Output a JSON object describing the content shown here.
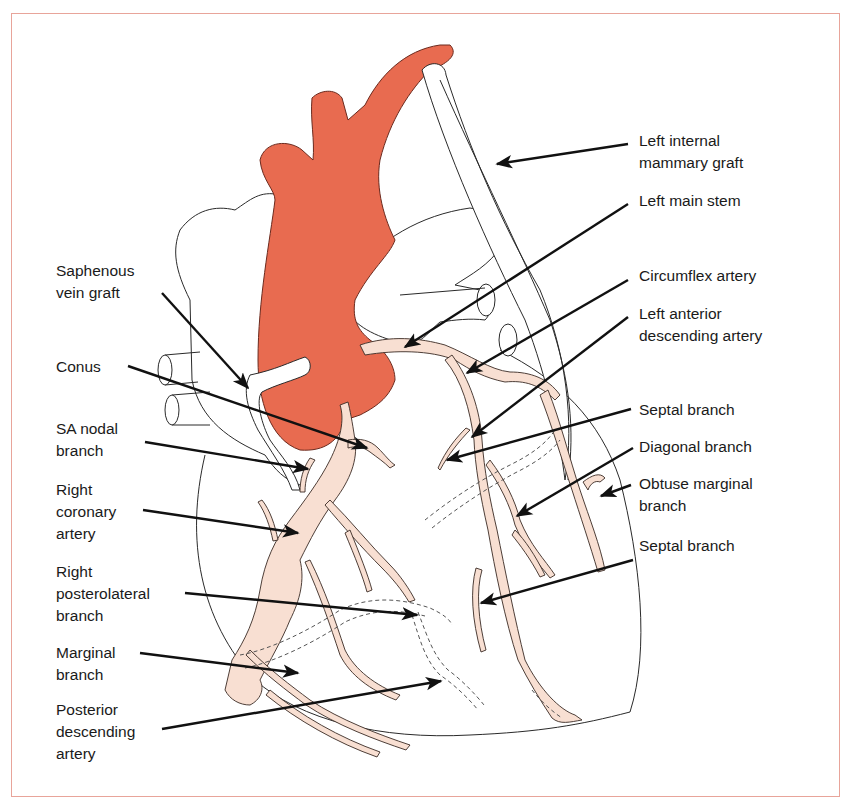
{
  "figure": {
    "colors": {
      "aorta": "#E86B50",
      "coronary": "#F8DFD2",
      "outline": "#2a2a2a",
      "frame": "#E8A49A",
      "arrow": "#111111"
    }
  },
  "labels": {
    "left": [
      {
        "id": "saphenous-vein-graft",
        "text": "Saphenous\nvein graft"
      },
      {
        "id": "conus",
        "text": "Conus"
      },
      {
        "id": "sa-nodal-branch",
        "text": "SA nodal\nbranch"
      },
      {
        "id": "right-coronary-artery",
        "text": "Right\ncoronary\nartery"
      },
      {
        "id": "right-posterolateral-branch",
        "text": "Right\nposterolateral\nbranch"
      },
      {
        "id": "marginal-branch",
        "text": "Marginal\nbranch"
      },
      {
        "id": "posterior-descending-artery",
        "text": "Posterior\ndescending\nartery"
      }
    ],
    "right": [
      {
        "id": "left-internal-mammary-graft",
        "text": "Left internal\nmammary graft"
      },
      {
        "id": "left-main-stem",
        "text": "Left main stem"
      },
      {
        "id": "circumflex-artery",
        "text": "Circumflex artery"
      },
      {
        "id": "left-anterior-descending-artery",
        "text": "Left anterior\ndescending artery"
      },
      {
        "id": "septal-branch-upper",
        "text": "Septal branch"
      },
      {
        "id": "diagonal-branch",
        "text": "Diagonal branch"
      },
      {
        "id": "obtuse-marginal-branch",
        "text": "Obtuse marginal\nbranch"
      },
      {
        "id": "septal-branch-lower",
        "text": "Septal branch"
      }
    ]
  }
}
